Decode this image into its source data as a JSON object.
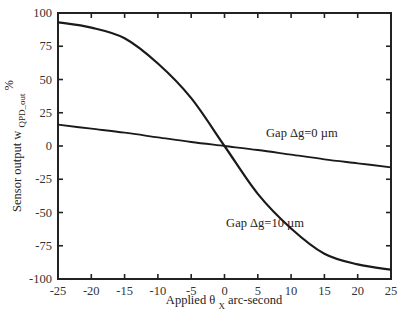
{
  "chart_data": {
    "type": "line",
    "title": "",
    "xlabel": "Applied θ x arc-second",
    "xlabel_parts": {
      "prefix": "Applied θ",
      "subscript": "X",
      "suffix": "arc-second"
    },
    "ylabel": "Sensor output w QPD_out %",
    "ylabel_parts": {
      "prefix": "Sensor output  w",
      "subscript": "QPD_out",
      "suffix": "%"
    },
    "xlim": [
      -25,
      25
    ],
    "ylim": [
      -100,
      100
    ],
    "xticks": [
      -25,
      -20,
      -15,
      -10,
      -5,
      0,
      5,
      10,
      15,
      20,
      25
    ],
    "xtick_labels": [
      "-25",
      "-20",
      "-15",
      "-10",
      "-5",
      "0",
      "5",
      "10",
      "15",
      "20",
      "25"
    ],
    "yticks": [
      -100,
      -75,
      -50,
      -25,
      0,
      25,
      50,
      75,
      100
    ],
    "ytick_labels": [
      "-100",
      "-75",
      "-50",
      "-25",
      "0",
      "25",
      "50",
      "75",
      "100"
    ],
    "grid": false,
    "legend": "none (inline annotations)",
    "x": [
      -25,
      -20,
      -15,
      -10,
      -5,
      0,
      5,
      10,
      15,
      20,
      25
    ],
    "series": [
      {
        "name": "Gap Δg=0 µm",
        "values": [
          16,
          13,
          10,
          6.5,
          3,
          0,
          -3,
          -6.5,
          -10,
          -13,
          -16
        ]
      },
      {
        "name": "Gap Δg=10 µm",
        "values": [
          93,
          89,
          81,
          62,
          36,
          0,
          -36,
          -62,
          -81,
          -89,
          -93
        ]
      }
    ],
    "annotations": [
      {
        "text": "Gap Δg=0 µm",
        "x": 13,
        "y": 7
      },
      {
        "text": "Gap Δg=10 µm",
        "x": 7,
        "y": -61
      }
    ]
  }
}
